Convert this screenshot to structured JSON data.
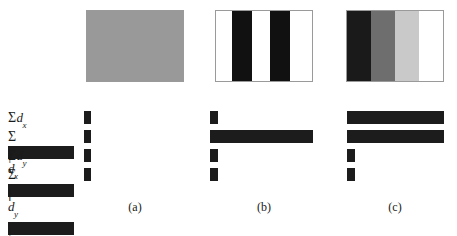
{
  "figure": {
    "row_labels": [
      {
        "symbol": "Σ",
        "abs": false,
        "var": "d",
        "sub": "x",
        "text": "Σdₓ"
      },
      {
        "symbol": "Σ",
        "abs": true,
        "var": "d",
        "sub": "x",
        "text": "Σ|dₓ|"
      },
      {
        "symbol": "Σ",
        "abs": false,
        "var": "d",
        "sub": "y",
        "text": "Σdᵧ"
      },
      {
        "symbol": "Σ",
        "abs": true,
        "var": "d",
        "sub": "y",
        "text": "Σ|dᵧ|"
      }
    ],
    "captions": [
      "(a)",
      "(b)",
      "(c)"
    ],
    "colors": {
      "bar": "#1c1c1c",
      "patch_border": "#9a9a9a",
      "background": "#ffffff",
      "flat_gray": "#999999",
      "black": "#111111",
      "white": "#ffffff",
      "dark_gray": "#6e6e6e",
      "light_gray": "#c9c9c9"
    }
  },
  "chart_data": [
    {
      "type": "bar",
      "title": "(a)",
      "orientation": "horizontal",
      "categories": [
        "Σdₓ",
        "Σ|dₓ|",
        "Σdᵧ",
        "Σ|dᵧ|"
      ],
      "values": [
        0,
        0,
        0,
        0
      ],
      "bar_px": [
        7,
        7,
        7,
        7
      ],
      "xlabel": "",
      "ylabel": "",
      "xlim": [
        0,
        100
      ],
      "grid": false,
      "legend": "none",
      "patch": {
        "description": "uniform flat gray region",
        "kind": "solid",
        "stripes": [
          {
            "color": "#999999",
            "width_pct": 100
          }
        ]
      }
    },
    {
      "type": "bar",
      "title": "(b)",
      "orientation": "horizontal",
      "categories": [
        "Σdₓ",
        "Σ|dₓ|",
        "Σdᵧ",
        "Σ|dᵧ|"
      ],
      "values": [
        0,
        100,
        0,
        0
      ],
      "bar_px": [
        8,
        103,
        8,
        8
      ],
      "xlabel": "",
      "ylabel": "",
      "xlim": [
        0,
        100
      ],
      "grid": false,
      "legend": "none",
      "patch": {
        "description": "vertical black and white bar pattern",
        "kind": "stripes",
        "stripes": [
          {
            "color": "#ffffff",
            "width_pct": 17
          },
          {
            "color": "#111111",
            "width_pct": 21
          },
          {
            "color": "#ffffff",
            "width_pct": 18
          },
          {
            "color": "#111111",
            "width_pct": 21
          },
          {
            "color": "#ffffff",
            "width_pct": 23
          }
        ]
      }
    },
    {
      "type": "bar",
      "title": "(c)",
      "orientation": "horizontal",
      "categories": [
        "Σdₓ",
        "Σ|dₓ|",
        "Σdᵧ",
        "Σ|dᵧ|"
      ],
      "values": [
        94,
        94,
        0,
        0
      ],
      "bar_px": [
        97,
        97,
        8,
        8
      ],
      "xlabel": "",
      "ylabel": "",
      "xlim": [
        0,
        100
      ],
      "grid": false,
      "legend": "none",
      "patch": {
        "description": "monotonic dark-to-light intensity ramp",
        "kind": "ramp",
        "stripes": [
          {
            "color": "#1a1a1a",
            "width_pct": 25
          },
          {
            "color": "#6e6e6e",
            "width_pct": 25
          },
          {
            "color": "#c9c9c9",
            "width_pct": 25
          },
          {
            "color": "#ffffff",
            "width_pct": 25
          }
        ]
      }
    }
  ]
}
